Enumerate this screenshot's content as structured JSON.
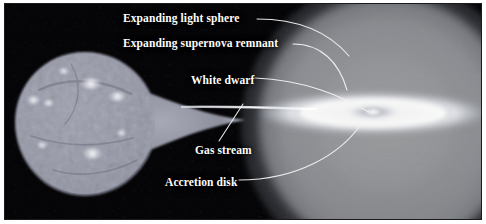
{
  "figure": {
    "kind": "astronomy-diagram",
    "background_color": "#050507",
    "border_color": "#1a1a1c",
    "page_color": "#ffffff"
  },
  "labels": [
    {
      "id": "expanding-light-sphere",
      "text": "Expanding light sphere",
      "x": 118,
      "y": 8,
      "size": 11.5
    },
    {
      "id": "expanding-supernova-remnant",
      "text": "Expanding supernova remnant",
      "x": 118,
      "y": 33,
      "size": 11.5
    },
    {
      "id": "white-dwarf",
      "text": "White dwarf",
      "x": 186,
      "y": 70,
      "size": 11.5
    },
    {
      "id": "gas-stream",
      "text": "Gas stream",
      "x": 190,
      "y": 140,
      "size": 11.5
    },
    {
      "id": "accretion-disk",
      "text": "Accretion disk",
      "x": 160,
      "y": 172,
      "size": 11.5
    }
  ],
  "objects": {
    "donor_star": {
      "name": "Companion star (Roche lobe filling)",
      "fill": "#9a9cab",
      "highlight": "#e9eaf2",
      "center_x": 95,
      "center_y": 120,
      "radius": 72
    },
    "gas_stream": {
      "name": "Gas stream",
      "color": "#e6e8ef",
      "from_x": 200,
      "to_x": 312
    },
    "accretion_disk": {
      "name": "Accretion disk",
      "ring_color": "#ffffff",
      "gap_color": "#8e929e",
      "center_x": 368,
      "center_y": 109,
      "width": 232,
      "height": 66
    },
    "white_dwarf": {
      "name": "White dwarf",
      "color": "#ffffff",
      "center_x": 368,
      "center_y": 109
    },
    "supernova_remnant": {
      "name": "Expanding supernova remnant",
      "color": "#e8ebf0",
      "center_x": 382,
      "center_y": 122,
      "radius": 128
    },
    "light_sphere": {
      "name": "Expanding light sphere",
      "color": "#d0d4dc",
      "center_x": 382,
      "center_y": 122,
      "radius": 146
    }
  },
  "leader_lines": {
    "color": "#f2f2f2",
    "width": 1.1
  }
}
